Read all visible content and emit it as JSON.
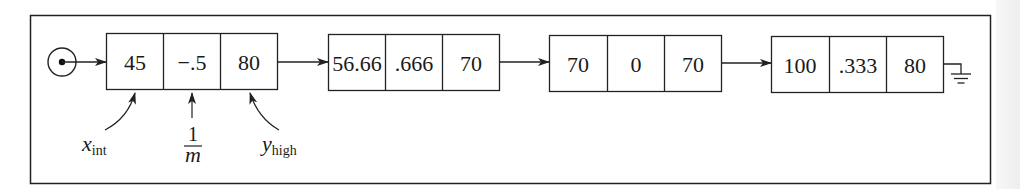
{
  "diagram": {
    "stroke_color": "#222222",
    "head_pointer": {
      "icon": "pointer-origin-icon"
    },
    "nodes": [
      {
        "cells": [
          "45",
          "−.5",
          "80"
        ]
      },
      {
        "cells": [
          "56.66",
          ".666",
          "70"
        ]
      },
      {
        "cells": [
          "70",
          "0",
          "70"
        ]
      },
      {
        "cells": [
          "100",
          ".333",
          "80"
        ]
      }
    ],
    "terminator": {
      "icon": "null-ground-icon"
    },
    "annotations": {
      "x_int": {
        "base": "x",
        "sub": "int"
      },
      "inv_m": {
        "numerator": "1",
        "denominator": "m"
      },
      "y_high": {
        "base": "y",
        "sub": "high"
      }
    }
  }
}
